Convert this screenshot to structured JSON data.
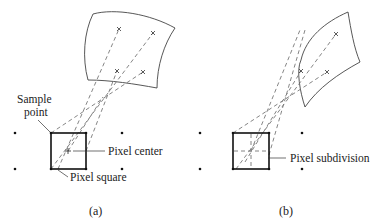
{
  "figure": {
    "panels": [
      {
        "id": "a",
        "caption": "(a)",
        "labels": {
          "sample_point": [
            "Sample",
            "point"
          ],
          "pixel_center": "Pixel center",
          "pixel_square": "Pixel square"
        }
      },
      {
        "id": "b",
        "caption": "(b)",
        "labels": {
          "pixel_subdivision": "Pixel subdivision"
        }
      }
    ]
  }
}
